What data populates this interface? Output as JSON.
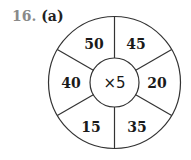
{
  "question": {
    "number": "16.",
    "part": "(a)"
  },
  "wheel": {
    "center_label": "×5",
    "segments": [
      {
        "position": "top-left",
        "value": "50"
      },
      {
        "position": "top-right",
        "value": "45"
      },
      {
        "position": "right",
        "value": "20"
      },
      {
        "position": "bottom-right",
        "value": "35"
      },
      {
        "position": "bottom-left",
        "value": "15"
      },
      {
        "position": "left",
        "value": "40"
      }
    ]
  },
  "colors": {
    "number": "#8a8a8a",
    "text": "#1a1a1a",
    "lines": "#333333",
    "background": "#ffffff"
  }
}
